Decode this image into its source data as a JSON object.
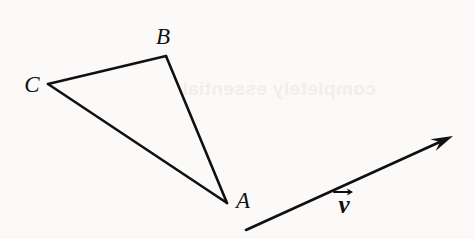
{
  "figure": {
    "background_color": "#fbfaf9",
    "ink_color": "#111010",
    "stroke_width": 2.6,
    "width": 475,
    "height": 239,
    "ghost_text": "completely essential"
  },
  "triangle": {
    "name": "triangle-ABC",
    "vertices": [
      {
        "id": "A",
        "label": "A",
        "x": 227,
        "y": 203,
        "label_x": 243,
        "label_y": 208,
        "label_size": 23
      },
      {
        "id": "B",
        "label": "B",
        "x": 166,
        "y": 56,
        "label_x": 163,
        "label_y": 44,
        "label_size": 23
      },
      {
        "id": "C",
        "label": "C",
        "x": 48,
        "y": 84,
        "label_x": 32,
        "label_y": 92,
        "label_size": 23
      }
    ],
    "edges": [
      {
        "id": "CB",
        "from": "C",
        "to": "B"
      },
      {
        "id": "BA",
        "from": "B",
        "to": "A"
      },
      {
        "id": "CA",
        "from": "C",
        "to": "A"
      }
    ]
  },
  "vector": {
    "name": "vector-v",
    "label": "ν",
    "accent": "arrow-right-accent",
    "label_x": 344,
    "label_y": 213,
    "tail": {
      "x": 246,
      "y": 230
    },
    "tip": {
      "x": 453,
      "y": 136
    },
    "arrowhead_length": 22,
    "arrowhead_halfwidth": 6.5
  }
}
